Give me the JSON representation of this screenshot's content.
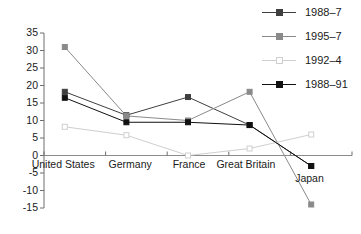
{
  "chart_data": {
    "type": "line",
    "title": "",
    "xlabel": "",
    "ylabel": "",
    "categories": [
      "United States",
      "Germany",
      "France",
      "Great Britain",
      "Japan"
    ],
    "ylim": [
      -15,
      35
    ],
    "yticks": [
      35,
      30,
      25,
      20,
      15,
      10,
      5,
      0,
      -5,
      -10,
      -15
    ],
    "ytick_labels": [
      "35",
      "30",
      "25",
      "20",
      "15",
      "10",
      "5",
      "0",
      "-5",
      "-10",
      "-15"
    ],
    "grid": false,
    "legend_position": "top-right",
    "series": [
      {
        "name": "1988–7",
        "color": "#3f3f3f",
        "marker": "filled-square",
        "values": [
          18.2,
          11.5,
          16.7,
          8.7,
          -3
        ]
      },
      {
        "name": "1995–7",
        "color": "#8a8a8a",
        "marker": "filled-square",
        "values": [
          31,
          11.3,
          10,
          18.2,
          -14
        ]
      },
      {
        "name": "1992–4",
        "color": "#cfcfcf",
        "marker": "hollow-square",
        "values": [
          8.2,
          5.8,
          0,
          2,
          6
        ]
      },
      {
        "name": "1988–91",
        "color": "#111111",
        "marker": "filled-square",
        "values": [
          16.5,
          9.5,
          9.5,
          8.7,
          -3
        ]
      }
    ]
  },
  "axes": {
    "axis_color": "#6e6e6e",
    "zero_line_color": "#8c8c8c"
  }
}
